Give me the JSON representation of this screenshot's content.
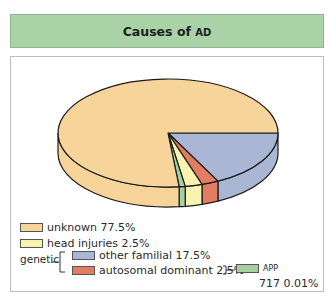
{
  "chart_data": {
    "type": "pie",
    "style": "3d",
    "title": "Causes of AD",
    "title_parts": {
      "main": "Causes of ",
      "acronym": "AD"
    },
    "slices": [
      {
        "key": "other_familial",
        "label": "other familial",
        "value": 17.5,
        "display": "other familial 17.5%",
        "color": "#a9b7d4",
        "group": "genetic"
      },
      {
        "key": "autosomal_dominant",
        "label": "autosomal dominant",
        "value": 2.5,
        "display": "autosomal dominant 2.5%",
        "color": "#e27d62",
        "group": "genetic"
      },
      {
        "key": "head_injuries",
        "label": "head injuries",
        "value": 2.5,
        "display": "head injuries 2.5%",
        "color": "#f8f3b0"
      },
      {
        "key": "app",
        "label": "APP 717",
        "value": 0.01,
        "display_label": "APP",
        "display_value": "717 0.01%",
        "color": "#a8cfa4"
      },
      {
        "key": "unknown",
        "label": "unknown",
        "value": 77.5,
        "display": "unknown 77.5%",
        "color": "#f6d49a"
      }
    ],
    "legend": {
      "group_label": "genetic",
      "placement": "bottom-left"
    }
  },
  "colors": {
    "title_bg": "#a9d3a6",
    "outline": "#1a1a1a"
  }
}
